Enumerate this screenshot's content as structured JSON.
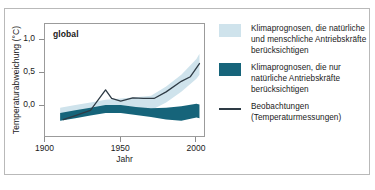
{
  "figure": {
    "border_color": "#b9b9b9"
  },
  "chart_data": {
    "type": "area",
    "title": "global",
    "xlabel": "Jahr",
    "ylabel": "Temperaturabweichung (°C)",
    "xlim": [
      1900,
      2005
    ],
    "ylim": [
      -0.45,
      1.25
    ],
    "xticks": [
      "1900",
      "1950",
      "2000"
    ],
    "xtick_values": [
      1900,
      1950,
      2000
    ],
    "yticks": [
      "1,0",
      "0,5",
      "0,0"
    ],
    "ytick_values": [
      1.0,
      0.5,
      0.0
    ],
    "grid": false,
    "legend_position": "right",
    "colors": {
      "band_all_forcings": "#cfe3ec",
      "band_natural_only": "#16647a",
      "observations_line": "#2e3b45",
      "frame": "#9b9b9b"
    },
    "series": [
      {
        "name": "Klimaprognosen, die natürliche und menschliche Antriebskräfte berücksichtigen",
        "type": "band",
        "color": "#cfe3ec",
        "x": [
          1910,
          1920,
          1930,
          1940,
          1950,
          1960,
          1970,
          1980,
          1990,
          2000,
          2002
        ],
        "upper": [
          -0.02,
          0.02,
          0.06,
          0.1,
          0.12,
          0.14,
          0.16,
          0.3,
          0.48,
          0.72,
          0.8
        ],
        "lower": [
          -0.22,
          -0.16,
          -0.12,
          -0.08,
          -0.06,
          -0.06,
          -0.06,
          0.06,
          0.22,
          0.42,
          0.48
        ]
      },
      {
        "name": "Klimaprognosen, die nur natürliche Antriebskräfte berücksichtigen",
        "type": "band",
        "color": "#16647a",
        "x": [
          1910,
          1920,
          1930,
          1940,
          1950,
          1960,
          1970,
          1980,
          1990,
          2000,
          2002
        ],
        "upper": [
          -0.1,
          -0.06,
          -0.02,
          0.02,
          0.02,
          -0.01,
          -0.03,
          -0.02,
          0.0,
          0.04,
          0.03
        ],
        "lower": [
          -0.22,
          -0.18,
          -0.14,
          -0.1,
          -0.1,
          -0.13,
          -0.16,
          -0.2,
          -0.22,
          -0.17,
          -0.18
        ]
      },
      {
        "name": "Beobachtungen (Temperaturmessungen)",
        "type": "line",
        "color": "#2e3b45",
        "x": [
          1912,
          1920,
          1930,
          1940,
          1944,
          1950,
          1958,
          1965,
          1972,
          1980,
          1990,
          1996,
          2002
        ],
        "y": [
          -0.2,
          -0.14,
          -0.06,
          0.25,
          0.12,
          0.08,
          0.13,
          0.12,
          0.12,
          0.22,
          0.38,
          0.45,
          0.65
        ]
      }
    ]
  },
  "legend": {
    "items": [
      {
        "kind": "swatch",
        "color": "#cfe3ec",
        "label": "Klimaprognosen, die natürliche und menschliche Antriebskräfte berücksichtigen"
      },
      {
        "kind": "swatch",
        "color": "#16647a",
        "label": "Klimaprognosen, die nur natürliche Antriebskräfte berücksichtigen"
      },
      {
        "kind": "line",
        "color": "#2e3b45",
        "label": "Beobachtungen (Temperaturmessungen)"
      }
    ]
  }
}
